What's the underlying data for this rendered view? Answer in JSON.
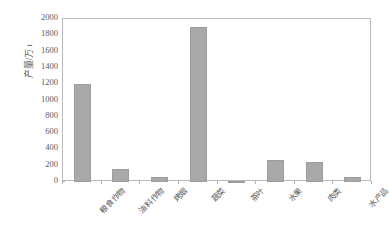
{
  "chart_data": {
    "type": "bar",
    "title": "",
    "subtitle": "",
    "xlabel": "",
    "ylabel": "产量/万 t",
    "categories": [
      "粮食作物",
      "油料作物",
      "烤烟",
      "蔬菜",
      "茶叶",
      "水果",
      "肉类",
      "水产品"
    ],
    "values": [
      1200,
      160,
      60,
      1900,
      15,
      270,
      245,
      60
    ],
    "ylim": [
      0,
      2000
    ],
    "ytick_labels": [
      "2000",
      "1800",
      "1600",
      "1400",
      "1200",
      "1000",
      "800",
      "600",
      "400",
      "200",
      "0"
    ],
    "ytick_values": [
      2000,
      1800,
      1600,
      1400,
      1200,
      1000,
      800,
      600,
      400,
      200,
      0
    ],
    "grid": false,
    "legend": false,
    "legend_position": "none",
    "series": [
      {
        "name": "产量",
        "values": [
          1200,
          160,
          60,
          1900,
          15,
          270,
          245,
          60
        ]
      }
    ],
    "colors": {
      "bar_fill": "#a9a9a9",
      "bar_stroke": "#9c9c9c",
      "axis": "#b9b9b9",
      "text": "#5a5a5a",
      "background": "#ffffff"
    }
  }
}
